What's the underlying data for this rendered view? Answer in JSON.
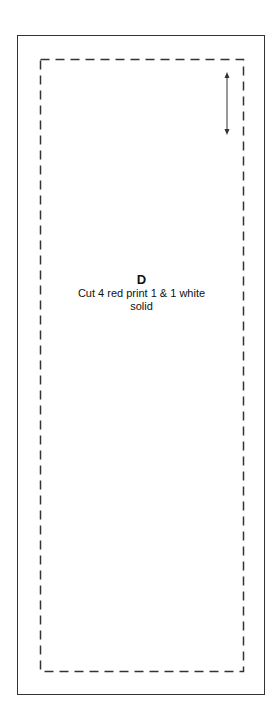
{
  "pattern_piece": {
    "letter": "D",
    "instruction_line1": "Cut 4 red print 1 & 1 white",
    "instruction_line2": "solid"
  },
  "colors": {
    "line": "#333333",
    "background": "#ffffff"
  },
  "icons": [
    "grainline-arrow-icon"
  ]
}
